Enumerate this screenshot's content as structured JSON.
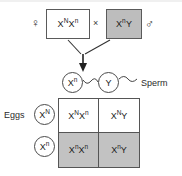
{
  "diagram": {
    "symbols": {
      "female": "♀",
      "male": "♂",
      "cross": "×"
    },
    "parents": {
      "female": {
        "allele1": "X",
        "sup1": "N",
        "allele2": "X",
        "sup2": "n",
        "fill": "#ffffff"
      },
      "male": {
        "allele1": "X",
        "sup1": "n",
        "allele2": "Y",
        "sup2": "",
        "fill": "#bdbdbd"
      }
    },
    "gametes": {
      "sperm_label": "Sperm",
      "eggs_label": "Eggs",
      "sperm": [
        {
          "allele": "X",
          "sup": "n"
        },
        {
          "allele": "Y",
          "sup": ""
        }
      ],
      "eggs": [
        {
          "allele": "X",
          "sup": "N"
        },
        {
          "allele": "X",
          "sup": "n"
        }
      ]
    },
    "punnett": {
      "rows": [
        {
          "shade": "white",
          "cells": [
            {
              "a1": "X",
              "s1": "N",
              "a2": "X",
              "s2": "n"
            },
            {
              "a1": "X",
              "s1": "N",
              "a2": "Y",
              "s2": ""
            }
          ]
        },
        {
          "shade": "gray",
          "cells": [
            {
              "a1": "X",
              "s1": "n",
              "a2": "X",
              "s2": "n"
            },
            {
              "a1": "X",
              "s1": "n",
              "a2": "Y",
              "s2": ""
            }
          ]
        }
      ]
    },
    "colors": {
      "affected_fill": "#c2c2c2",
      "unaffected_fill": "#ffffff",
      "line": "#555555"
    }
  }
}
